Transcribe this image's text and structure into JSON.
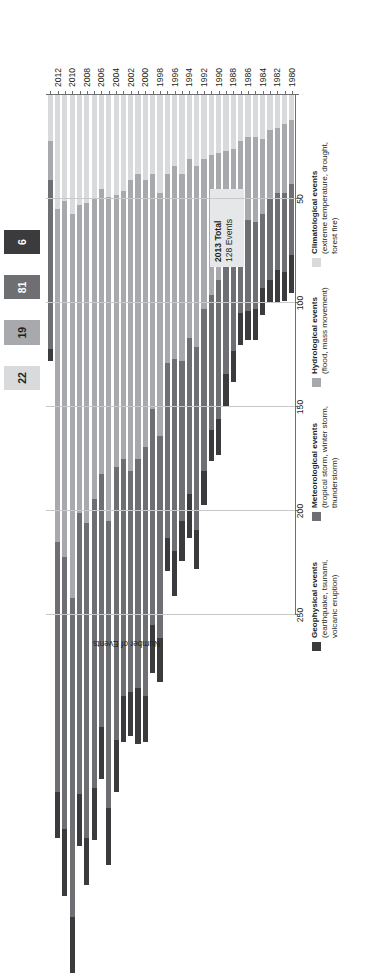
{
  "chart_data": {
    "type": "bar",
    "orientation": "horizontal-rotated",
    "title": "",
    "xlabel": "Number of Events",
    "ylabel": "",
    "xlim": [
      0,
      250
    ],
    "xticks": [
      250,
      200,
      150,
      100,
      50
    ],
    "grid": true,
    "legend_position": "right",
    "categories": [
      "1980",
      "1981",
      "1982",
      "1983",
      "1984",
      "1985",
      "1986",
      "1987",
      "1988",
      "1989",
      "1990",
      "1991",
      "1992",
      "1993",
      "1994",
      "1995",
      "1996",
      "1997",
      "1998",
      "1999",
      "2000",
      "2001",
      "2002",
      "2003",
      "2004",
      "2005",
      "2006",
      "2007",
      "2008",
      "2009",
      "2010",
      "2011",
      "2012",
      "2013"
    ],
    "tick_labels": [
      "1980",
      "1982",
      "1984",
      "1986",
      "1988",
      "1990",
      "1992",
      "1994",
      "1996",
      "1998",
      "2000",
      "2002",
      "2004",
      "2006",
      "2008",
      "2010",
      "2012"
    ],
    "series": [
      {
        "name": "Geophysical events",
        "color": "#3b3b3d",
        "values": [
          18,
          14,
          16,
          11,
          13,
          15,
          14,
          15,
          15,
          16,
          17,
          15,
          16,
          19,
          21,
          19,
          22,
          16,
          21,
          23,
          22,
          27,
          21,
          22,
          25,
          27,
          25,
          25,
          23,
          25,
          27,
          32,
          22,
          6
        ]
      },
      {
        "name": "Meteorological events",
        "color": "#6e6f72",
        "values": [
          34,
          38,
          37,
          39,
          36,
          42,
          44,
          41,
          49,
          56,
          67,
          65,
          78,
          88,
          75,
          77,
          92,
          84,
          97,
          104,
          120,
          110,
          106,
          114,
          131,
          138,
          122,
          139,
          151,
          135,
          153,
          131,
          120,
          81
        ]
      },
      {
        "name": "Hydrological events",
        "color": "#a7a9ac",
        "values": [
          31,
          33,
          31,
          33,
          36,
          41,
          40,
          42,
          48,
          51,
          61,
          67,
          72,
          87,
          86,
          90,
          93,
          91,
          117,
          113,
          128,
          137,
          140,
          129,
          131,
          156,
          137,
          144,
          154,
          148,
          185,
          171,
          160,
          19
        ]
      },
      {
        "name": "Climatological events",
        "color": "#d9dadb",
        "values": [
          12,
          14,
          16,
          17,
          21,
          20,
          20,
          22,
          26,
          27,
          28,
          29,
          31,
          34,
          31,
          38,
          34,
          38,
          47,
          38,
          41,
          38,
          41,
          46,
          48,
          49,
          45,
          50,
          52,
          53,
          57,
          51,
          55,
          22
        ]
      }
    ],
    "total_2013_segments": {
      "climatological": 22,
      "hydrological": 19,
      "meteorological": 81,
      "geophysical": 6
    }
  },
  "count_boxes": [
    {
      "value": "22",
      "bg": "#d9dadb",
      "fg": "#231f20",
      "name": "climatological"
    },
    {
      "value": "19",
      "bg": "#a7a9ac",
      "fg": "#231f20",
      "name": "hydrological"
    },
    {
      "value": "81",
      "bg": "#6e6f72",
      "fg": "#ffffff",
      "name": "meteorological"
    },
    {
      "value": "6",
      "bg": "#3b3b3d",
      "fg": "#ffffff",
      "name": "geophysical"
    }
  ],
  "legend": [
    {
      "title": "Geophysical events",
      "subtitle": "(earthquake, tsunami, volcanic eruption)",
      "color": "#3b3b3d"
    },
    {
      "title": "Meteorological events",
      "subtitle": "(tropical storm, winter storm, thunderstorm)",
      "color": "#6e6f72"
    },
    {
      "title": "Hydrological events",
      "subtitle": "(flood, mass movement)",
      "color": "#a7a9ac"
    },
    {
      "title": "Climatological events",
      "subtitle": "(extreme temperature, drought, forest fire)",
      "color": "#d9dadb"
    }
  ],
  "annotation": {
    "line1": "2013 Total",
    "line2": "128 Events"
  },
  "axis": {
    "value_axis_title": "Number of Events"
  }
}
